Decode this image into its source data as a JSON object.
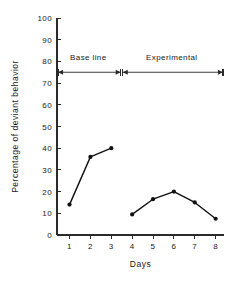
{
  "chart_data": {
    "type": "line",
    "title": "",
    "xlabel": "Days",
    "ylabel": "Percentage of deviant behavior",
    "xlim": [
      0.4,
      8.4
    ],
    "ylim": [
      0,
      100
    ],
    "grid": false,
    "legend": "none",
    "x_ticks": [
      1,
      2,
      3,
      4,
      5,
      6,
      7,
      8
    ],
    "x_tick_labels": [
      "1",
      "2",
      "3",
      "4",
      "5",
      "6",
      "7",
      "8"
    ],
    "y_ticks": [
      0,
      10,
      20,
      30,
      40,
      50,
      60,
      70,
      80,
      90,
      100
    ],
    "y_tick_labels": [
      "0",
      "10",
      "20",
      "30",
      "40",
      "50",
      "60",
      "70",
      "80",
      "90",
      "100"
    ],
    "series": [
      {
        "name": "Base line",
        "x": [
          1,
          2,
          3
        ],
        "values": [
          14,
          36,
          40
        ]
      },
      {
        "name": "Experimental",
        "x": [
          4,
          5,
          6,
          7,
          8
        ],
        "values": [
          9.5,
          16.5,
          20,
          15,
          7.5
        ]
      }
    ],
    "annotations": [
      {
        "label": "Base line",
        "kind": "phase-arrow",
        "y": 75,
        "x_start": 0.45,
        "x_end": 3.45,
        "label_x": 1.9,
        "label_y": 80.5
      },
      {
        "label": "Experimental",
        "kind": "phase-arrow",
        "y": 75,
        "x_start": 3.55,
        "x_end": 8.35,
        "label_x": 5.9,
        "label_y": 80.5
      }
    ]
  },
  "figure": {
    "background_color": "#ffffff",
    "ink_color": "#111111",
    "axis_color": "#2b2b2b"
  }
}
